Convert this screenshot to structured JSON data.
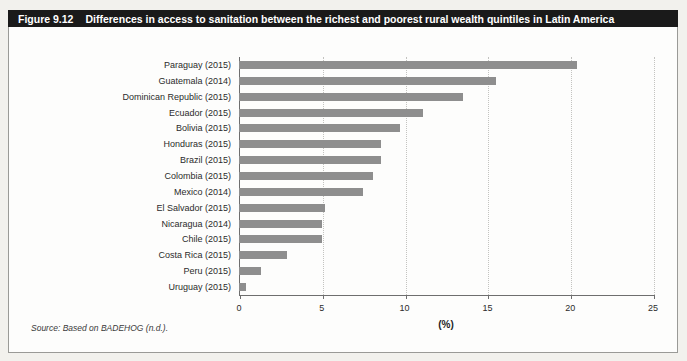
{
  "figure": {
    "label": "Figure 9.12",
    "title": "Differences in access to sanitation between the richest and poorest rural wealth quintiles in Latin America",
    "source": "Source: Based on BADEHOG (n.d.)."
  },
  "colors": {
    "bar": "#8e8e8e",
    "header_bg": "#1a1a1a",
    "header_text": "#ffffff"
  },
  "chart_data": {
    "type": "bar",
    "orientation": "horizontal",
    "title": "Differences in access to sanitation between the richest and poorest rural wealth quintiles in Latin America",
    "categories": [
      "Paraguay (2015)",
      "Guatemala (2014)",
      "Dominican Republic (2015)",
      "Ecuador (2015)",
      "Bolivia (2015)",
      "Honduras (2015)",
      "Brazil (2015)",
      "Colombia (2015)",
      "Mexico (2014)",
      "El Salvador (2015)",
      "Nicaragua (2014)",
      "Chile (2015)",
      "Costa Rica (2015)",
      "Peru (2015)",
      "Uruguay (2015)"
    ],
    "values": [
      20.4,
      15.5,
      13.5,
      11.1,
      9.7,
      8.6,
      8.6,
      8.1,
      7.5,
      5.2,
      5.0,
      5.0,
      2.9,
      1.3,
      0.4
    ],
    "xlabel": "(%)",
    "xlim": [
      0,
      25
    ],
    "xticks": [
      0,
      5,
      10,
      15,
      20,
      25
    ],
    "grid": "dotted-vertical-at-ticks",
    "legend": "none"
  }
}
